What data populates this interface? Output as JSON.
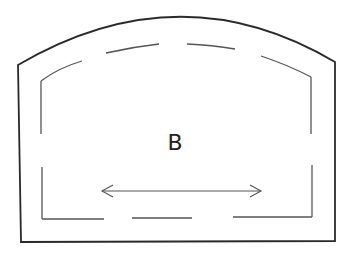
{
  "diagram": {
    "type": "arched-frame-with-dashed-inset",
    "label": "B",
    "colors": {
      "background": "#ffffff",
      "outer_stroke": "#2a2a2a",
      "inner_stroke": "#555555",
      "text": "#222222"
    },
    "outer_frame": {
      "top_left": [
        18,
        65
      ],
      "arch_apex": [
        180,
        18
      ],
      "top_right": [
        335,
        62
      ],
      "bottom_right": [
        335,
        241
      ],
      "bottom_left": [
        21,
        242
      ]
    },
    "inner_dashed_frame": {
      "top_left": [
        41,
        81
      ],
      "top_right": [
        311,
        77
      ],
      "bottom_right": [
        312,
        217
      ],
      "bottom_left": [
        42,
        219
      ]
    },
    "dimension_arrow": {
      "style": "double-headed",
      "from": [
        102,
        191
      ],
      "to": [
        261,
        191
      ]
    }
  }
}
